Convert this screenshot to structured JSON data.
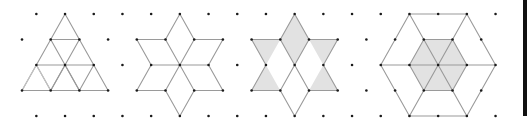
{
  "lattice": {
    "origin_x": 22,
    "origin_y": 14,
    "half_step_x": 14.35,
    "step_y": 25.5,
    "rows": 5,
    "even_row_cols": [
      1,
      33
    ],
    "odd_row_cols": [
      0,
      32
    ],
    "dot_radius": 1.3
  },
  "colors": {
    "background": "#ffffff",
    "line": "#9a9a9a",
    "shade": "#e2e2e2",
    "dot": "#1a1a1a",
    "bar": "#111111"
  },
  "figures": [
    {
      "name": "subdivided-triangle",
      "shaded": [],
      "edges": [
        [
          [
            3,
            0
          ],
          [
            0,
            3
          ]
        ],
        [
          [
            3,
            0
          ],
          [
            6,
            3
          ]
        ],
        [
          [
            0,
            3
          ],
          [
            6,
            3
          ]
        ],
        [
          [
            2,
            1
          ],
          [
            4,
            1
          ]
        ],
        [
          [
            1,
            2
          ],
          [
            5,
            2
          ]
        ],
        [
          [
            2,
            1
          ],
          [
            4,
            3
          ]
        ],
        [
          [
            4,
            1
          ],
          [
            2,
            3
          ]
        ],
        [
          [
            1,
            2
          ],
          [
            2,
            3
          ]
        ],
        [
          [
            5,
            2
          ],
          [
            4,
            3
          ]
        ],
        [
          [
            3,
            2
          ],
          [
            2,
            3
          ]
        ],
        [
          [
            3,
            2
          ],
          [
            4,
            3
          ]
        ]
      ],
      "faint_edges": [
        [
          [
            0,
            3
          ],
          [
            1,
            2
          ]
        ],
        [
          [
            1,
            2
          ],
          [
            2,
            3
          ]
        ]
      ]
    },
    {
      "name": "six-rhombus-star",
      "shaded": [],
      "edges": [
        [
          [
            11,
            0
          ],
          [
            12,
            1
          ]
        ],
        [
          [
            12,
            1
          ],
          [
            14,
            1
          ]
        ],
        [
          [
            14,
            1
          ],
          [
            13,
            2
          ]
        ],
        [
          [
            13,
            2
          ],
          [
            14,
            3
          ]
        ],
        [
          [
            14,
            3
          ],
          [
            12,
            3
          ]
        ],
        [
          [
            12,
            3
          ],
          [
            11,
            4
          ]
        ],
        [
          [
            11,
            4
          ],
          [
            10,
            3
          ]
        ],
        [
          [
            10,
            3
          ],
          [
            8,
            3
          ]
        ],
        [
          [
            8,
            3
          ],
          [
            9,
            2
          ]
        ],
        [
          [
            9,
            2
          ],
          [
            8,
            1
          ]
        ],
        [
          [
            8,
            1
          ],
          [
            10,
            1
          ]
        ],
        [
          [
            10,
            1
          ],
          [
            11,
            0
          ]
        ],
        [
          [
            9,
            2
          ],
          [
            13,
            2
          ]
        ],
        [
          [
            10,
            1
          ],
          [
            12,
            3
          ]
        ],
        [
          [
            12,
            1
          ],
          [
            10,
            3
          ]
        ]
      ],
      "faint_edges": []
    },
    {
      "name": "shaded-star",
      "shaded": [
        [
          [
            19,
            0
          ],
          [
            20,
            1
          ],
          [
            19,
            2
          ],
          [
            18,
            1
          ]
        ],
        [
          [
            16,
            1
          ],
          [
            18,
            1
          ],
          [
            17,
            2
          ]
        ],
        [
          [
            20,
            1
          ],
          [
            22,
            1
          ],
          [
            21,
            2
          ]
        ],
        [
          [
            17,
            2
          ],
          [
            18,
            3
          ],
          [
            16,
            3
          ]
        ],
        [
          [
            21,
            2
          ],
          [
            22,
            3
          ],
          [
            20,
            3
          ]
        ]
      ],
      "edges": [
        [
          [
            19,
            0
          ],
          [
            20,
            1
          ]
        ],
        [
          [
            20,
            1
          ],
          [
            22,
            1
          ]
        ],
        [
          [
            22,
            1
          ],
          [
            21,
            2
          ]
        ],
        [
          [
            21,
            2
          ],
          [
            22,
            3
          ]
        ],
        [
          [
            22,
            3
          ],
          [
            20,
            3
          ]
        ],
        [
          [
            20,
            3
          ],
          [
            19,
            4
          ]
        ],
        [
          [
            19,
            4
          ],
          [
            18,
            3
          ]
        ],
        [
          [
            18,
            3
          ],
          [
            16,
            3
          ]
        ],
        [
          [
            16,
            3
          ],
          [
            17,
            2
          ]
        ],
        [
          [
            17,
            2
          ],
          [
            16,
            1
          ]
        ],
        [
          [
            16,
            1
          ],
          [
            18,
            1
          ]
        ],
        [
          [
            18,
            1
          ],
          [
            19,
            0
          ]
        ],
        [
          [
            18,
            1
          ],
          [
            20,
            3
          ]
        ],
        [
          [
            20,
            1
          ],
          [
            18,
            3
          ]
        ]
      ],
      "faint_edges": []
    },
    {
      "name": "hexagon-with-shaded-center",
      "shaded": [
        [
          [
            28,
            1
          ],
          [
            30,
            1
          ],
          [
            31,
            2
          ],
          [
            30,
            3
          ],
          [
            28,
            3
          ],
          [
            27,
            2
          ]
        ]
      ],
      "edges": [
        [
          [
            27,
            0
          ],
          [
            31,
            0
          ]
        ],
        [
          [
            31,
            0
          ],
          [
            33,
            2
          ]
        ],
        [
          [
            33,
            2
          ],
          [
            31,
            4
          ]
        ],
        [
          [
            31,
            4
          ],
          [
            27,
            4
          ]
        ],
        [
          [
            27,
            4
          ],
          [
            25,
            2
          ]
        ],
        [
          [
            25,
            2
          ],
          [
            27,
            0
          ]
        ],
        [
          [
            25,
            2
          ],
          [
            33,
            2
          ]
        ],
        [
          [
            27,
            0
          ],
          [
            31,
            4
          ]
        ],
        [
          [
            31,
            0
          ],
          [
            27,
            4
          ]
        ],
        [
          [
            28,
            1
          ],
          [
            30,
            1
          ]
        ],
        [
          [
            30,
            1
          ],
          [
            31,
            2
          ]
        ],
        [
          [
            31,
            2
          ],
          [
            30,
            3
          ]
        ],
        [
          [
            30,
            3
          ],
          [
            28,
            3
          ]
        ],
        [
          [
            28,
            3
          ],
          [
            27,
            2
          ]
        ],
        [
          [
            27,
            2
          ],
          [
            28,
            1
          ]
        ]
      ],
      "faint_edges": []
    }
  ],
  "right_bar": {
    "visible": true
  }
}
